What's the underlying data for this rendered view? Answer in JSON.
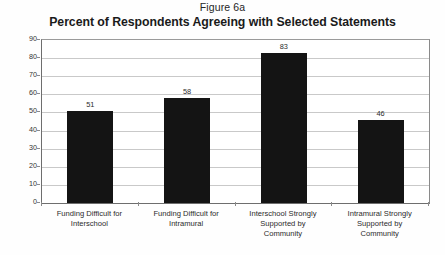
{
  "chart_data": {
    "type": "bar",
    "title": "Percent of Respondents Agreeing with Selected Statements",
    "figure_label": "Figure 6a",
    "xlabel": "",
    "ylabel": "",
    "ylim": [
      0,
      90
    ],
    "ytick_step": 10,
    "yticks": [
      "90",
      "80",
      "70",
      "60",
      "50",
      "40",
      "30",
      "20",
      "10",
      "0"
    ],
    "grid": true,
    "legend": false,
    "bar_color": "#141414",
    "categories": [
      "Funding Difficult for Interschool",
      "Funding Difficult for Intramural",
      "Interschool Strongly Supported by Community",
      "Intramural Strongly Supported by Community"
    ],
    "category_lines": [
      [
        "Funding Difficult for",
        "Interschool"
      ],
      [
        "Funding Difficult for",
        "Intramural"
      ],
      [
        "Interschool Strongly",
        "Supported by",
        "Community"
      ],
      [
        "Intramural Strongly",
        "Supported by",
        "Community"
      ]
    ],
    "values": [
      51,
      58,
      83,
      46
    ],
    "value_labels": [
      "51",
      "58",
      "83",
      "46"
    ]
  }
}
